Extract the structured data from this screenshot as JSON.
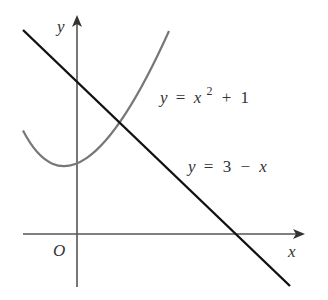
{
  "figure": {
    "type": "function-graph",
    "axes": {
      "x_label": "x",
      "y_label": "y",
      "origin_label": "O",
      "color": "#555555"
    },
    "curves": [
      {
        "name": "parabola",
        "equation_label": {
          "lhs": "y",
          "eq": "=",
          "var": "x",
          "exp": "2",
          "op": "+",
          "const": "1"
        },
        "color": "#777777"
      },
      {
        "name": "line",
        "equation_label": {
          "lhs": "y",
          "eq": "=",
          "const": "3",
          "op": "−",
          "var": "x"
        },
        "color": "#111111"
      }
    ]
  }
}
